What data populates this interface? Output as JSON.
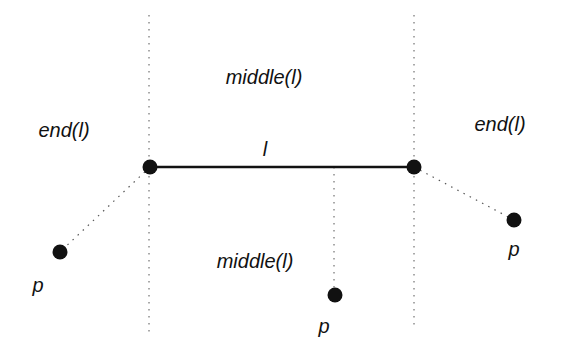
{
  "diagram": {
    "segment": {
      "label": "l",
      "x1": 150,
      "y1": 167,
      "x2": 414,
      "y2": 167
    },
    "regions": {
      "middle_top": "middle(l)",
      "middle_bottom": "middle(l)",
      "end_left": "end(l)",
      "end_right": "end(l)"
    },
    "points": [
      {
        "label": "p",
        "x": 60,
        "y": 252,
        "region": "end_left"
      },
      {
        "label": "p",
        "x": 335,
        "y": 295,
        "region": "middle"
      },
      {
        "label": "p",
        "x": 514,
        "y": 220,
        "region": "end_right"
      }
    ],
    "colors": {
      "ink": "#111111",
      "dotted": "#555555",
      "background": "#ffffff"
    }
  }
}
